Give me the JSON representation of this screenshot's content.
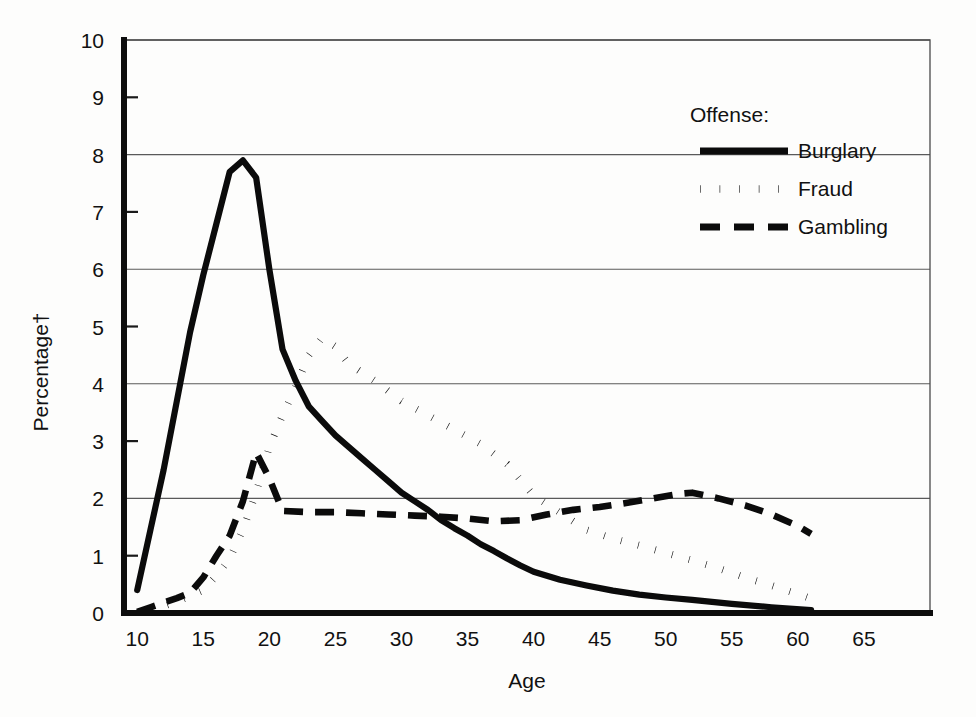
{
  "chart_data": {
    "type": "line",
    "title": "",
    "xlabel": "Age",
    "ylabel": "Percentage†",
    "xlim": [
      9,
      70
    ],
    "ylim": [
      0,
      10
    ],
    "xticks": [
      10,
      15,
      20,
      25,
      30,
      35,
      40,
      45,
      50,
      55,
      60,
      65
    ],
    "yticks": [
      0,
      1,
      2,
      3,
      4,
      5,
      6,
      7,
      8,
      9,
      10
    ],
    "gridlines_y": [
      0,
      2,
      4,
      6,
      8,
      10
    ],
    "grid": "horizontal-even-only",
    "legend": {
      "title": "Offense:",
      "position": "upper-right-inside",
      "entries": [
        {
          "label": "Burglary",
          "style": "solid"
        },
        {
          "label": "Fraud",
          "style": "dotted"
        },
        {
          "label": "Gambling",
          "style": "dashed"
        }
      ]
    },
    "series": [
      {
        "name": "Burglary",
        "style": "solid",
        "x": [
          10,
          11,
          12,
          13,
          14,
          15,
          16,
          17,
          18,
          19,
          20,
          21,
          22,
          23,
          24,
          25,
          26,
          27,
          28,
          29,
          30,
          31,
          32,
          33,
          34,
          35,
          36,
          37,
          38,
          39,
          40,
          42,
          44,
          46,
          48,
          50,
          52,
          55,
          58,
          61
        ],
        "values": [
          0.4,
          1.45,
          2.5,
          3.7,
          4.9,
          5.9,
          6.8,
          7.7,
          7.9,
          7.6,
          6.0,
          4.6,
          4.05,
          3.6,
          3.35,
          3.1,
          2.9,
          2.7,
          2.5,
          2.3,
          2.1,
          1.95,
          1.8,
          1.62,
          1.48,
          1.35,
          1.2,
          1.08,
          0.95,
          0.83,
          0.72,
          0.58,
          0.48,
          0.39,
          0.32,
          0.27,
          0.23,
          0.16,
          0.1,
          0.05
        ]
      },
      {
        "name": "Fraud",
        "style": "dotted",
        "x": [
          11,
          12,
          13,
          14,
          15,
          16,
          17,
          18,
          19,
          20,
          21,
          22,
          23,
          24,
          25,
          26,
          27,
          28,
          30,
          32,
          34,
          36,
          38,
          40,
          42,
          44,
          46,
          48,
          50,
          52,
          54,
          56,
          58,
          60,
          61
        ],
        "values": [
          0.05,
          0.12,
          0.2,
          0.3,
          0.4,
          0.65,
          0.95,
          1.45,
          2.1,
          2.9,
          3.45,
          3.95,
          4.5,
          4.8,
          4.65,
          4.35,
          4.2,
          4.05,
          3.7,
          3.45,
          3.2,
          2.95,
          2.6,
          2.05,
          1.75,
          1.45,
          1.3,
          1.18,
          1.05,
          0.92,
          0.78,
          0.62,
          0.48,
          0.33,
          0.25
        ]
      },
      {
        "name": "Gambling",
        "style": "dashed",
        "x": [
          10,
          11,
          12,
          13,
          14,
          15,
          16,
          17,
          18,
          19,
          20,
          21,
          23,
          25,
          27,
          29,
          31,
          33,
          35,
          37,
          39,
          41,
          43,
          45,
          47,
          49,
          51,
          52,
          54,
          56,
          58,
          60,
          61
        ],
        "values": [
          0.02,
          0.1,
          0.18,
          0.26,
          0.35,
          0.62,
          1.0,
          1.35,
          1.95,
          2.8,
          2.35,
          1.78,
          1.76,
          1.76,
          1.74,
          1.72,
          1.7,
          1.68,
          1.65,
          1.6,
          1.62,
          1.72,
          1.8,
          1.85,
          1.92,
          2.0,
          2.08,
          2.1,
          2.0,
          1.88,
          1.72,
          1.52,
          1.38
        ]
      }
    ]
  }
}
